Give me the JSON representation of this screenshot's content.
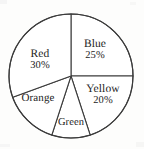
{
  "figure": {
    "kind": "pie-chart",
    "background_color": "#fdfdfc",
    "line_color": "#3b3b3b",
    "text_color": "#232323"
  },
  "chart_data": {
    "type": "pie",
    "title": "",
    "subtitle": "",
    "xlabel": "",
    "ylabel": "",
    "grid": false,
    "legend": "none",
    "labels_inside_slices": true,
    "center": {
      "x": 71,
      "y": 76
    },
    "radius": 62,
    "start_angle_deg": 90,
    "direction": "clockwise",
    "categories": [
      "Blue",
      "Yellow",
      "Green",
      "Orange",
      "Red"
    ],
    "values": [
      25,
      20,
      10,
      15,
      30
    ],
    "slices": [
      {
        "name": "Blue",
        "label": "Blue",
        "percent_label": "25%",
        "value": 25,
        "start_angle_deg": 90,
        "end_angle_deg": 0,
        "fill": "#ffffff"
      },
      {
        "name": "Yellow",
        "label": "Yellow",
        "percent_label": "20%",
        "value": 20,
        "start_angle_deg": 0,
        "end_angle_deg": -72,
        "fill": "#ffffff"
      },
      {
        "name": "Green",
        "label": "Green",
        "percent_label": "",
        "value": 10,
        "start_angle_deg": -72,
        "end_angle_deg": -108,
        "fill": "#ffffff"
      },
      {
        "name": "Orange",
        "label": "Orange",
        "percent_label": "",
        "value": 15,
        "start_angle_deg": -108,
        "end_angle_deg": -160,
        "fill": "#ffffff"
      },
      {
        "name": "Red",
        "label": "Red",
        "percent_label": "30%",
        "value": 30,
        "start_angle_deg": -160,
        "end_angle_deg": -270,
        "fill": "#ffffff"
      }
    ]
  }
}
